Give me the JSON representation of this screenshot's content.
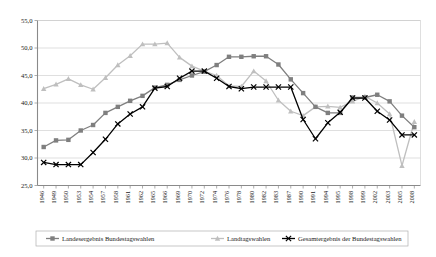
{
  "chart_data": {
    "type": "line",
    "title": "",
    "subtitle": "",
    "xlabel": "",
    "ylabel": "",
    "ylim": [
      25.0,
      55.0
    ],
    "yticks": [
      "25,0",
      "30,0",
      "35,0",
      "40,0",
      "45,0",
      "50,0",
      "55,0"
    ],
    "ytick_values": [
      25.0,
      30.0,
      35.0,
      40.0,
      45.0,
      50.0,
      55.0
    ],
    "grid": true,
    "legend_position": "bottom",
    "categories": [
      "1946",
      "1949",
      "1950",
      "1953",
      "1954",
      "1957",
      "1958",
      "1961",
      "1962",
      "1965",
      "1966",
      "1969",
      "1970",
      "1972",
      "1974",
      "1976",
      "1978",
      "1980",
      "1982",
      "1983",
      "1987",
      "1990",
      "1991",
      "1994",
      "1995",
      "1998",
      "1999",
      "2002",
      "2003",
      "2005",
      "2008"
    ],
    "series": [
      {
        "name": "Landesergebnis Bundestagswahlen",
        "color": "#7f7f7f",
        "marker": "square",
        "values": [
          32.0,
          33.2,
          33.3,
          35.0,
          36.0,
          38.2,
          39.3,
          40.4,
          41.3,
          42.8,
          43.3,
          44.2,
          45.0,
          45.7,
          46.9,
          48.4,
          48.4,
          48.5,
          48.5,
          47.0,
          44.3,
          41.8,
          39.3,
          38.2,
          38.2,
          41.0,
          41.0,
          41.5,
          40.3,
          37.7,
          35.6
        ]
      },
      {
        "name": "Landtagswahlen",
        "color": "#bfbfbf",
        "marker": "triangle",
        "values": [
          42.6,
          43.4,
          44.4,
          43.3,
          42.5,
          44.6,
          46.9,
          48.6,
          50.7,
          50.7,
          50.9,
          48.3,
          46.7,
          45.8,
          45.0,
          43.1,
          43.0,
          45.8,
          44.0,
          40.5,
          38.5,
          37.7,
          39.3,
          39.4,
          39.2,
          40.3,
          41.2,
          40.0,
          38.0,
          28.6,
          36.6
        ]
      },
      {
        "name": "Gesamtergebnis der Bundestagswahlen",
        "color": "#000000",
        "marker": "x",
        "values": [
          29.2,
          28.8,
          28.8,
          28.8,
          31.0,
          33.4,
          36.2,
          38.0,
          39.3,
          42.7,
          43.0,
          44.5,
          45.8,
          45.8,
          44.5,
          43.0,
          42.6,
          42.9,
          42.9,
          42.9,
          42.9,
          37.0,
          33.5,
          36.4,
          38.3,
          40.9,
          40.9,
          38.5,
          36.9,
          34.2,
          34.2
        ]
      }
    ]
  },
  "legend": {
    "items": [
      {
        "label": "Landesergebnis Bundestagswahlen",
        "color": "#7f7f7f",
        "marker": "square"
      },
      {
        "label": "Landtagswahlen",
        "color": "#bfbfbf",
        "marker": "triangle"
      },
      {
        "label": "Gesamtergebnis der Bundestagswahlen",
        "color": "#000000",
        "marker": "x"
      }
    ]
  }
}
